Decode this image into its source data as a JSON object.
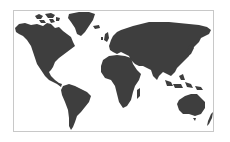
{
  "map": {
    "type": "world-silhouette",
    "land_color": "#3e3e3e",
    "background_color": "#ffffff",
    "border_color": "#c8c8c8",
    "regions": [
      "north-america",
      "greenland",
      "south-america",
      "europe-asia",
      "africa",
      "madagascar",
      "southeast-asia-islands",
      "japan",
      "australia",
      "new-zealand",
      "british-isles",
      "iceland",
      "arctic-islands"
    ]
  }
}
